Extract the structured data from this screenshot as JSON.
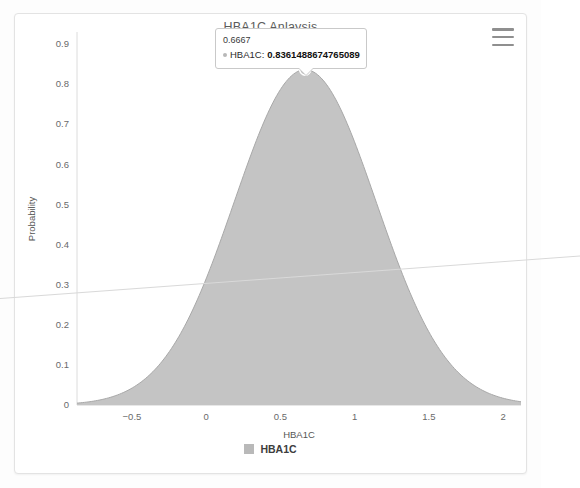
{
  "card": {
    "menu_icon": "hamburger-menu-icon"
  },
  "chart_data": {
    "type": "area",
    "title": "HBA1C Anlaysis",
    "xlabel": "HBA1C",
    "ylabel": "Probability",
    "xlim": [
      -0.87,
      2.12
    ],
    "ylim": [
      0,
      0.93
    ],
    "grid": false,
    "legend_position": "bottom",
    "series": [
      {
        "name": "HBA1C",
        "color": "#c4c4c4",
        "stroke": "#a8a8a8",
        "distribution": "normal-density",
        "mean": 0.6667,
        "sigma": 0.4772,
        "peak_x": 0.6667,
        "peak_y": 0.8361488674765089,
        "x": [
          -0.87,
          -0.75,
          -0.6,
          -0.5,
          -0.4,
          -0.25,
          -0.1,
          0,
          0.1,
          0.25,
          0.4,
          0.5,
          0.6,
          0.6667,
          0.75,
          0.85,
          1,
          1.1,
          1.25,
          1.4,
          1.5,
          1.6,
          1.75,
          1.9,
          2.0,
          2.12
        ],
        "y": [
          0.0076,
          0.0152,
          0.0312,
          0.0484,
          0.0718,
          0.1227,
          0.1936,
          0.2522,
          0.3174,
          0.4231,
          0.5295,
          0.5959,
          0.6939,
          0.8361,
          0.8291,
          0.8048,
          0.7374,
          0.679,
          0.5767,
          0.4657,
          0.3925,
          0.3209,
          0.2255,
          0.1492,
          0.109,
          0.072
        ]
      }
    ],
    "x_ticks": [
      {
        "value": -0.5,
        "label": "−0.5"
      },
      {
        "value": 0,
        "label": "0"
      },
      {
        "value": 0.5,
        "label": "0.5"
      },
      {
        "value": 1,
        "label": "1"
      },
      {
        "value": 1.5,
        "label": "1.5"
      },
      {
        "value": 2,
        "label": "2"
      }
    ],
    "y_ticks": [
      {
        "value": 0,
        "label": "0"
      },
      {
        "value": 0.1,
        "label": "0.1"
      },
      {
        "value": 0.2,
        "label": "0.2"
      },
      {
        "value": 0.3,
        "label": "0.3"
      },
      {
        "value": 0.4,
        "label": "0.4"
      },
      {
        "value": 0.5,
        "label": "0.5"
      },
      {
        "value": 0.6,
        "label": "0.6"
      },
      {
        "value": 0.7,
        "label": "0.7"
      },
      {
        "value": 0.8,
        "label": "0.8"
      },
      {
        "value": 0.9,
        "label": "0.9"
      }
    ],
    "legend": [
      {
        "label": "HBA1C",
        "color": "#b9b9b9"
      }
    ],
    "annotations": [
      {
        "type": "tooltip",
        "x_label": "0.6667",
        "series_name": "HBA1C",
        "value": "0.8361488674765089",
        "marker_color": "#b8b8b8"
      }
    ]
  }
}
